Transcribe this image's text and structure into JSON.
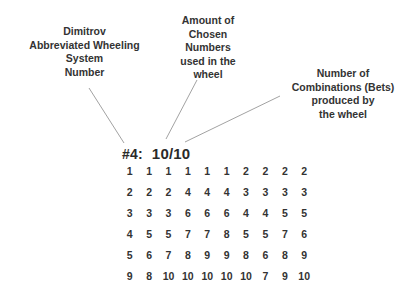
{
  "annotations": {
    "system_number_label": "Dimitrov\nAbbreviated Wheeling\nSystem\nNumber",
    "chosen_numbers_label": "Amount of\nChosen\nNumbers\nused in the\nwheel",
    "combinations_label": "Number of\nCombinations (Bets)\nproduced by\nthe wheel"
  },
  "wheel": {
    "id": "#4:",
    "ratio": "10/10",
    "rows": [
      [
        "1",
        "1",
        "1",
        "1",
        "1",
        "1",
        "2",
        "2",
        "2",
        "2"
      ],
      [
        "2",
        "2",
        "2",
        "4",
        "4",
        "4",
        "3",
        "3",
        "3",
        "3"
      ],
      [
        "3",
        "3",
        "3",
        "6",
        "6",
        "6",
        "4",
        "4",
        "5",
        "5"
      ],
      [
        "4",
        "5",
        "5",
        "7",
        "7",
        "8",
        "5",
        "5",
        "7",
        "6"
      ],
      [
        "5",
        "6",
        "7",
        "8",
        "9",
        "9",
        "8",
        "6",
        "8",
        "9"
      ],
      [
        "9",
        "8",
        "10",
        "10",
        "10",
        "10",
        "10",
        "7",
        "9",
        "10"
      ]
    ]
  }
}
